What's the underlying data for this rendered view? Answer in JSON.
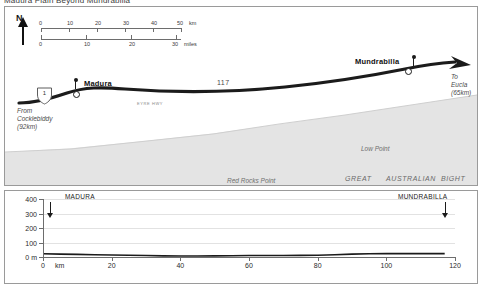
{
  "document": {
    "title": "Madura  Plain Beyond Mundrabilla"
  },
  "map": {
    "north_label": "N",
    "scale": {
      "km_labels": [
        "0",
        "10",
        "20",
        "30",
        "40",
        "50"
      ],
      "km_unit": "km",
      "km_values": [
        0,
        10,
        20,
        30,
        40,
        50
      ],
      "mile_labels": [
        "0",
        "10",
        "20",
        "30"
      ],
      "mile_unit": "miles",
      "mile_values": [
        0,
        10,
        20,
        30
      ]
    },
    "highway_shield": "1",
    "highway_number": "117",
    "highway_name": "EYRE  HWY",
    "places": [
      {
        "name": "Madura"
      },
      {
        "name": "Mundrabilla"
      }
    ],
    "origin_note": "From\nCocklebiddy\n(92km)",
    "origin_note_lines": [
      "From",
      "Cocklebiddy",
      "(92km)"
    ],
    "destination_note_lines": [
      "To",
      "Eucla",
      "(65km)"
    ],
    "sea_labels": {
      "low_point": "Low Point",
      "red_rocks_point": "Red Rocks Point",
      "bight_words": [
        "GREAT",
        "AUSTRALIAN",
        "BIGHT"
      ]
    }
  },
  "chart_data": {
    "type": "line",
    "title": "",
    "xlabel": "km",
    "ylabel": "m",
    "xlim": [
      0,
      120
    ],
    "ylim": [
      0,
      400
    ],
    "grid": true,
    "xticks": [
      0,
      20,
      40,
      60,
      80,
      100,
      120
    ],
    "xtick_labels": [
      "0",
      "20",
      "40",
      "60",
      "80",
      "100",
      "120"
    ],
    "yticks": [
      0,
      100,
      200,
      300,
      400
    ],
    "ytick_labels": [
      "0 m",
      "100",
      "200",
      "300",
      "400"
    ],
    "x": [
      0,
      5,
      10,
      15,
      20,
      25,
      30,
      35,
      40,
      45,
      50,
      55,
      60,
      65,
      70,
      75,
      80,
      85,
      90,
      95,
      100,
      105,
      110,
      117
    ],
    "y": [
      22,
      20,
      18,
      16,
      14,
      12,
      10,
      8,
      7,
      7,
      8,
      9,
      10,
      10,
      10,
      11,
      12,
      16,
      20,
      22,
      23,
      23,
      23,
      23
    ],
    "markers": [
      {
        "label": "MADURA",
        "x": 2
      },
      {
        "label": "MUNDRABILLA",
        "x": 117
      }
    ]
  }
}
